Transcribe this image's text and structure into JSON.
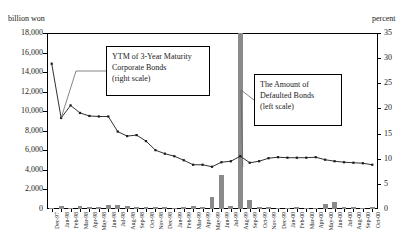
{
  "axis_units": {
    "left": "billion won",
    "right": "percent"
  },
  "callouts": {
    "ytm": "YTM of 3-Year Maturity\nCorporate Bonds\n(right scale)",
    "defaulted": "The Amount of\nDefaulted Bonds\n(left scale)"
  },
  "chart_data": {
    "type": "bar",
    "title": "",
    "subtitle": "",
    "xlabel": "",
    "ylabel": "billion won",
    "y2label": "percent",
    "ylim": [
      0,
      18000
    ],
    "y2lim": [
      0,
      35
    ],
    "yticks": [
      "0",
      "2,000",
      "4,000",
      "6,000",
      "8,000",
      "10,000",
      "12,000",
      "14,000",
      "16,000",
      "18,000"
    ],
    "y2ticks": [
      "0",
      "5",
      "10",
      "15",
      "20",
      "25",
      "30",
      "35"
    ],
    "grid": false,
    "legend_position": "callout-boxes",
    "categories": [
      "Dec-97",
      "Jan-98",
      "Feb-98",
      "Mar-98",
      "Apr-98",
      "May-98",
      "Jun-98",
      "Jul-98",
      "Aug-98",
      "Sep-98",
      "Oct-98",
      "Nov-98",
      "Dec-98",
      "Jan-99",
      "Feb-99",
      "Mar-99",
      "Apr-99",
      "May-99",
      "Jun-99",
      "Jul-99",
      "Aug-99",
      "Sep-99",
      "Oct-99",
      "Nov-99",
      "Dec-99",
      "Jan-00",
      "Feb-00",
      "Mar-00",
      "Apr-00",
      "May-00",
      "Jun-00",
      "Jul-00",
      "Aug-00",
      "Sep-00",
      "Oct-00"
    ],
    "series": [
      {
        "name": "The Amount of Defaulted Bonds",
        "type": "bar",
        "axis": "left",
        "unit": "billion won",
        "color": "#8a8a8a",
        "values": [
          120,
          260,
          150,
          330,
          180,
          200,
          420,
          380,
          260,
          240,
          200,
          180,
          210,
          150,
          190,
          300,
          170,
          1200,
          3500,
          260,
          18000,
          900,
          230,
          170,
          150,
          140,
          160,
          150,
          130,
          480,
          760,
          200,
          170,
          150,
          180
        ]
      },
      {
        "name": "YTM of 3-Year Maturity Corporate Bonds",
        "type": "line",
        "axis": "right",
        "unit": "percent",
        "color": "#1a1a1a",
        "values": [
          28.9,
          18.1,
          20.6,
          19.1,
          18.5,
          18.4,
          18.4,
          15.4,
          14.5,
          14.7,
          13.5,
          11.7,
          11.0,
          10.5,
          9.7,
          8.8,
          8.8,
          8.4,
          9.3,
          9.5,
          10.5,
          9.2,
          9.5,
          10.1,
          10.3,
          10.2,
          10.2,
          10.2,
          10.3,
          9.8,
          9.5,
          9.3,
          9.2,
          9.1,
          8.8
        ]
      }
    ]
  }
}
